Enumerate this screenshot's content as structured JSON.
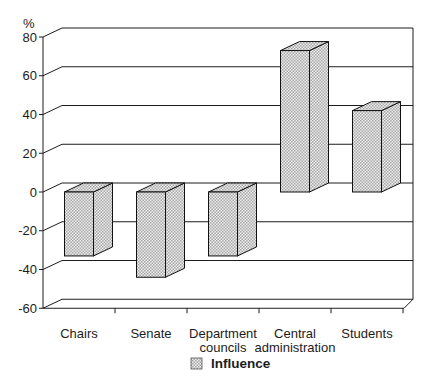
{
  "figure": {
    "kind": "scanned 3D bar chart"
  },
  "chart_data": {
    "type": "bar",
    "categories": [
      "Chairs",
      "Senate",
      "Department councils",
      "Central administration",
      "Students"
    ],
    "values": [
      -33,
      -44,
      -33,
      73,
      42
    ],
    "series": [
      {
        "name": "Influence",
        "values": [
          -33,
          -44,
          -33,
          73,
          42
        ]
      }
    ],
    "ylabel": "%",
    "ylim": [
      -60,
      80
    ],
    "yticks": [
      80,
      60,
      40,
      20,
      0,
      -20,
      -40,
      -60
    ],
    "grid": true,
    "legend": [
      "Influence"
    ],
    "legend_position": "bottom-center",
    "style_3d": true,
    "colors": {
      "line": "#1c1c1c",
      "bar_hatch_dark": "#a9a9a9",
      "bar_hatch_light": "#ececec",
      "background": "#ffffff"
    }
  }
}
